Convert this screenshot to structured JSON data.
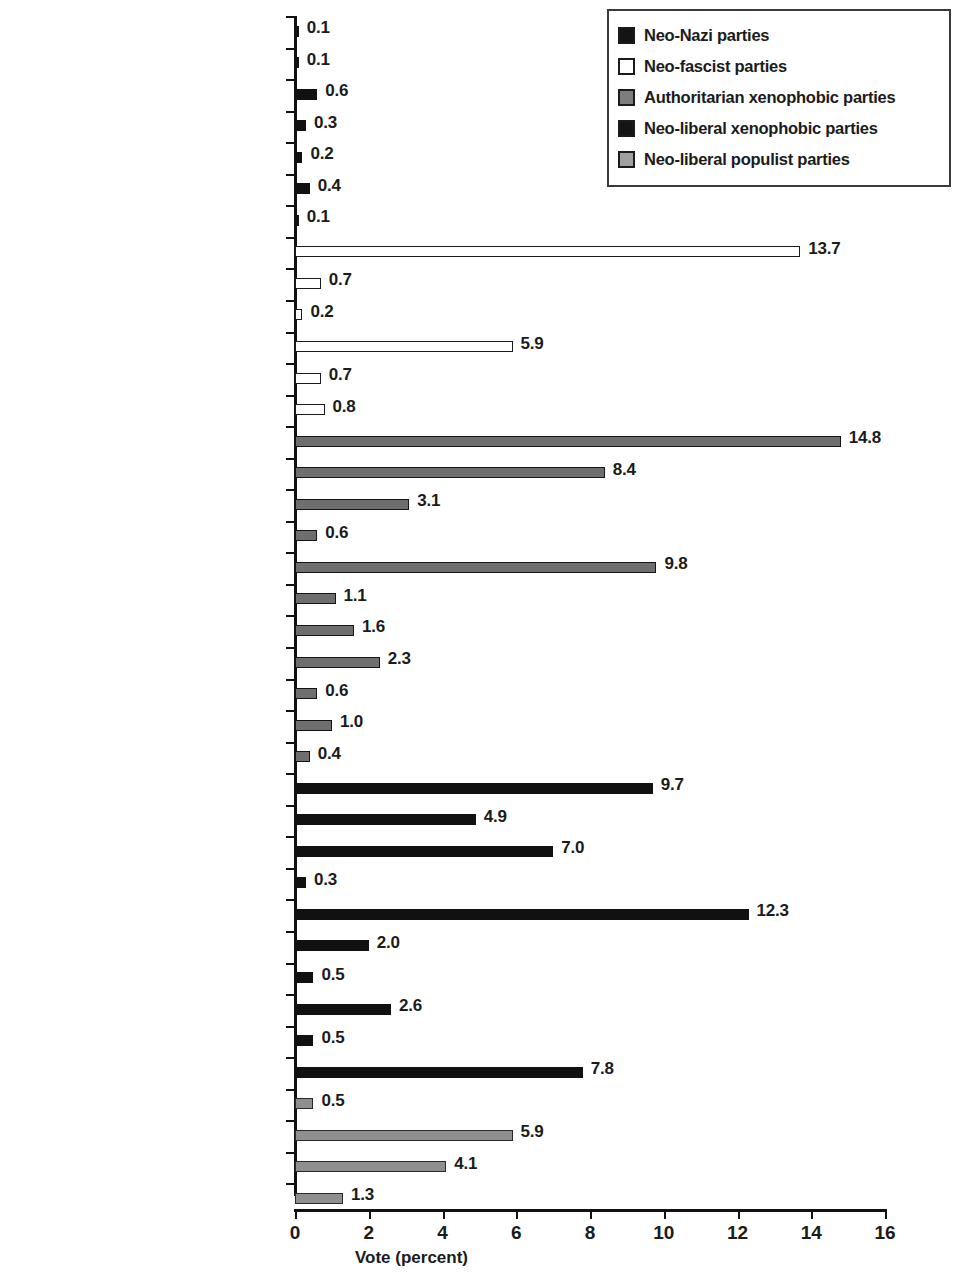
{
  "chart_data": {
    "type": "bar",
    "orientation": "horizontal",
    "title": "",
    "xlabel": "Vote (percent)",
    "ylabel": "",
    "xlim": [
      0,
      16
    ],
    "xticks": [
      0,
      2,
      4,
      6,
      8,
      10,
      12,
      14,
      16
    ],
    "grid": false,
    "legend_position": "top-right",
    "legend": [
      {
        "key": "neonazi",
        "label": "Neo-Nazi parties",
        "color": "#141414"
      },
      {
        "key": "neofascist",
        "label": "Neo-fascist parties",
        "color": "#ffffff"
      },
      {
        "key": "authoritarian",
        "label": "Authoritarian xenophobic parties",
        "color": "#7d7d7d"
      },
      {
        "key": "neoliberalxeno",
        "label": "Neo-liberal xenophobic parties",
        "color": "#141414"
      },
      {
        "key": "neoliberalpop",
        "label": "Neo-liberal populist parties",
        "color": "#a0a0a0"
      }
    ],
    "categories": [
      "BNP",
      "NF",
      "DVU",
      "NPD",
      "PFNb",
      "CP'86",
      "NVU",
      "AN",
      "Ms-Ft",
      "Falangistas",
      "MSI",
      "PDC",
      "Fuerza Nueva/Frente Nacional",
      "FPÖ",
      "VB",
      "FN(b)",
      "FNB",
      "FN",
      "MNR",
      "Republikaner",
      "SD",
      "Agir",
      "CD",
      "CP",
      "DF",
      "FRPd (mid-1980s+)",
      "LN (mid-1990s+)",
      "FLP",
      "FRPn (mid-1980s+)",
      "ND",
      "SDk",
      "FPS",
      "DNP",
      "FRPd (until mid-1980s)",
      "KP/EPEN/EK",
      "LN (until mid-1990s)",
      "FRPn (until mid-1980s)",
      "LdT"
    ],
    "values": [
      0.1,
      0.1,
      0.6,
      0.3,
      0.2,
      0.4,
      0.1,
      13.7,
      0.7,
      0.2,
      5.9,
      0.7,
      0.8,
      14.8,
      8.4,
      3.1,
      0.6,
      9.8,
      1.1,
      1.6,
      2.3,
      0.6,
      1.0,
      0.4,
      9.7,
      4.9,
      7.0,
      0.3,
      12.3,
      2.0,
      0.5,
      2.6,
      0.5,
      7.8,
      0.5,
      5.9,
      4.1,
      1.3
    ],
    "value_labels": [
      "0.1",
      "0.1",
      "0.6",
      "0.3",
      "0.2",
      "0.4",
      "0.1",
      "13.7",
      "0.7",
      "0.2",
      "5.9",
      "0.7",
      "0.8",
      "14.8",
      "8.4",
      "3.1",
      "0.6",
      "9.8",
      "1.1",
      "1.6",
      "2.3",
      "0.6",
      "1.0",
      "0.4",
      "9.7",
      "4.9",
      "7.0",
      "0.3",
      "12.3",
      "2.0",
      "0.5",
      "2.6",
      "0.5",
      "7.8",
      "0.5",
      "5.9",
      "4.1",
      "1.3"
    ],
    "series_keys": [
      "neonazi",
      "neonazi",
      "neonazi",
      "neonazi",
      "neonazi",
      "neonazi",
      "neonazi",
      "neofascist",
      "neofascist",
      "neofascist",
      "neofascist",
      "neofascist",
      "neofascist",
      "authoritarian",
      "authoritarian",
      "authoritarian",
      "authoritarian",
      "authoritarian",
      "authoritarian",
      "authoritarian",
      "authoritarian",
      "authoritarian",
      "authoritarian",
      "authoritarian",
      "neoliberalxeno",
      "neoliberalxeno",
      "neoliberalxeno",
      "neoliberalxeno",
      "neoliberalxeno",
      "neoliberalxeno",
      "neoliberalxeno",
      "neoliberalxeno",
      "neoliberalxeno",
      "neoliberalxeno",
      "neoliberalpop",
      "neoliberalpop",
      "neoliberalpop",
      "neoliberalpop"
    ]
  }
}
